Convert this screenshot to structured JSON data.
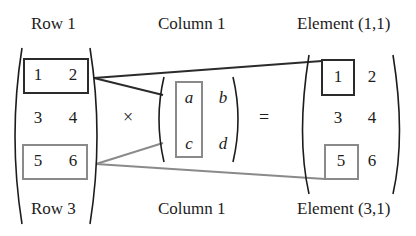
{
  "labels": {
    "left_top": "Row 1",
    "left_bottom": "Row 3",
    "middle_top": "Column 1",
    "middle_bottom": "Column 1",
    "right_top": "Element (1,1)",
    "right_bottom": "Element (3,1)"
  },
  "left_matrix": {
    "rows": [
      [
        "1",
        "2"
      ],
      [
        "3",
        "4"
      ],
      [
        "5",
        "6"
      ]
    ],
    "highlighted_rows": [
      {
        "index": 0,
        "color": "#2b2b2b"
      },
      {
        "index": 2,
        "color": "#8a8a8a"
      }
    ]
  },
  "operators": {
    "times": "×",
    "equals": "="
  },
  "middle_matrix": {
    "rows": [
      [
        "a",
        "b"
      ],
      [
        "c",
        "d"
      ]
    ],
    "highlighted_column": {
      "index": 0,
      "color": "#8a8a8a"
    }
  },
  "right_matrix": {
    "rows": [
      [
        "1",
        "2"
      ],
      [
        "3",
        "4"
      ],
      [
        "5",
        "6"
      ]
    ],
    "highlighted_cells": [
      {
        "row": 0,
        "col": 0,
        "color": "#2b2b2b"
      },
      {
        "row": 2,
        "col": 0,
        "color": "#8a8a8a"
      }
    ]
  },
  "colors": {
    "dark": "#2b2b2b",
    "gray": "#8a8a8a"
  }
}
